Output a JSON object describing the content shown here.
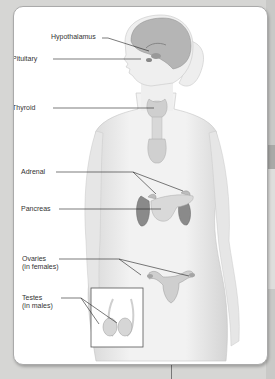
{
  "diagram": {
    "labels": {
      "hypothalamus": "Hypothalamus",
      "pituitary": "Pituitary",
      "thyroid": "Thyroid",
      "adrenal": "Adrenal",
      "pancreas": "Pancreas",
      "ovaries_line1": "Ovaries",
      "ovaries_line2": "(in females)",
      "testes_line1": "Testes",
      "testes_line2": "(in males)"
    },
    "colors": {
      "skin": "#ececec",
      "brain": "#b5b5b5",
      "organ_dark": "#8a8a8a",
      "organ_light": "#cfcfcf",
      "leader_line": "#222222"
    }
  }
}
